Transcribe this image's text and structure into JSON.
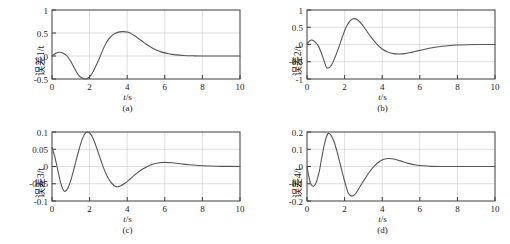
{
  "figure": {
    "panel_count": 4,
    "line_color": "#555555",
    "axis_color": "#3c3c3c",
    "grid_color": "#c8c8c8",
    "background": "#ffffff"
  },
  "panels": [
    {
      "id": "a",
      "caption": "(a)",
      "ylabel": "误差1/t",
      "xlabel_html": "<i>t</i>/s",
      "xticks": [
        "0",
        "2",
        "4",
        "6",
        "8",
        "10"
      ],
      "yticks": [
        "1",
        "0.5",
        "0",
        "-0.5"
      ]
    },
    {
      "id": "b",
      "caption": "(b)",
      "ylabel": "误差2/t",
      "xlabel_html": "<i>t</i>/s",
      "xticks": [
        "0",
        "2",
        "4",
        "6",
        "8",
        "10"
      ],
      "yticks": [
        "1",
        "0.5",
        "0",
        "-0.5",
        "-1"
      ]
    },
    {
      "id": "c",
      "caption": "(c)",
      "ylabel": "误差3/t",
      "xlabel_html": "<i>t</i>/s",
      "xticks": [
        "0",
        "2",
        "4",
        "6",
        "8",
        "10"
      ],
      "yticks": [
        "0.1",
        "0.05",
        "0",
        "-0.05",
        "-0.1"
      ]
    },
    {
      "id": "d",
      "caption": "(d)",
      "ylabel": "误差4/t",
      "xlabel_html": "<i>t</i>/s",
      "xticks": [
        "0",
        "2",
        "4",
        "6",
        "8",
        "10"
      ],
      "yticks": [
        "0.2",
        "0.1",
        "0",
        "-0.1",
        "-0.2"
      ]
    }
  ],
  "chart_data": [
    {
      "type": "line",
      "id": "a",
      "title": "(a)",
      "xlabel": "t/s",
      "ylabel": "误差1/t",
      "xlim": [
        0,
        10
      ],
      "ylim": [
        -0.5,
        1
      ],
      "xticks": [
        0,
        2,
        4,
        6,
        8,
        10
      ],
      "yticks": [
        -0.5,
        0,
        0.5,
        1
      ],
      "grid": true,
      "legend": "none",
      "series": [
        {
          "name": "误差1",
          "x": [
            0,
            0.2,
            0.4,
            0.6,
            0.8,
            1.0,
            1.2,
            1.4,
            1.6,
            1.8,
            2.0,
            2.2,
            2.4,
            2.6,
            2.8,
            3.0,
            3.2,
            3.4,
            3.6,
            3.8,
            4.0,
            4.2,
            4.4,
            4.6,
            4.8,
            5.0,
            5.4,
            5.8,
            6.2,
            6.6,
            7.0,
            7.5,
            8.0,
            9.0,
            10.0
          ],
          "y": [
            0.0,
            0.06,
            0.08,
            0.06,
            0.0,
            -0.12,
            -0.27,
            -0.41,
            -0.48,
            -0.5,
            -0.45,
            -0.33,
            -0.16,
            0.03,
            0.22,
            0.36,
            0.45,
            0.5,
            0.525,
            0.53,
            0.52,
            0.49,
            0.44,
            0.38,
            0.32,
            0.26,
            0.16,
            0.09,
            0.05,
            0.025,
            0.012,
            0.004,
            0.0,
            0.0,
            0.0
          ]
        }
      ]
    },
    {
      "type": "line",
      "id": "b",
      "title": "(b)",
      "xlabel": "t/s",
      "ylabel": "误差2/t",
      "xlim": [
        0,
        10
      ],
      "ylim": [
        -1,
        1
      ],
      "xticks": [
        0,
        2,
        4,
        6,
        8,
        10
      ],
      "yticks": [
        -1,
        -0.5,
        0,
        0.5,
        1
      ],
      "grid": true,
      "legend": "none",
      "series": [
        {
          "name": "误差2",
          "x": [
            0,
            0.15,
            0.25,
            0.4,
            0.6,
            0.8,
            1.0,
            1.1,
            1.3,
            1.5,
            1.7,
            1.9,
            2.1,
            2.3,
            2.5,
            2.7,
            2.9,
            3.1,
            3.4,
            3.7,
            4.0,
            4.3,
            4.6,
            4.9,
            5.2,
            5.6,
            6.0,
            6.5,
            7.0,
            7.5,
            8.0,
            8.5,
            9.0,
            10.0
          ],
          "y": [
            0.0,
            0.11,
            0.13,
            0.09,
            -0.04,
            -0.3,
            -0.62,
            -0.69,
            -0.6,
            -0.36,
            -0.07,
            0.25,
            0.52,
            0.69,
            0.75,
            0.71,
            0.6,
            0.45,
            0.22,
            0.02,
            -0.13,
            -0.22,
            -0.265,
            -0.275,
            -0.265,
            -0.22,
            -0.17,
            -0.11,
            -0.065,
            -0.035,
            -0.015,
            -0.006,
            -0.002,
            0.0
          ]
        }
      ]
    },
    {
      "type": "line",
      "id": "c",
      "title": "(c)",
      "xlabel": "t/s",
      "ylabel": "误差3/t",
      "xlim": [
        0,
        10
      ],
      "ylim": [
        -0.1,
        0.1
      ],
      "xticks": [
        0,
        2,
        4,
        6,
        8,
        10
      ],
      "yticks": [
        -0.1,
        -0.05,
        0,
        0.05,
        0.1
      ],
      "grid": true,
      "legend": "none",
      "series": [
        {
          "name": "误差3",
          "x": [
            0,
            0.15,
            0.3,
            0.45,
            0.6,
            0.7,
            0.85,
            1.0,
            1.2,
            1.4,
            1.6,
            1.8,
            2.0,
            2.2,
            2.4,
            2.6,
            2.8,
            3.0,
            3.2,
            3.4,
            3.6,
            3.9,
            4.2,
            4.5,
            4.8,
            5.1,
            5.4,
            5.7,
            6.0,
            6.4,
            6.8,
            7.3,
            7.8,
            8.4,
            9.0,
            10.0
          ],
          "y": [
            0.055,
            0.028,
            -0.008,
            -0.045,
            -0.068,
            -0.072,
            -0.062,
            -0.04,
            0.0,
            0.042,
            0.078,
            0.098,
            0.097,
            0.08,
            0.05,
            0.018,
            -0.012,
            -0.035,
            -0.05,
            -0.058,
            -0.057,
            -0.048,
            -0.034,
            -0.02,
            -0.008,
            0.001,
            0.007,
            0.011,
            0.012,
            0.011,
            0.008,
            0.005,
            0.003,
            0.0015,
            0.0005,
            0.0
          ]
        }
      ]
    },
    {
      "type": "line",
      "id": "d",
      "title": "(d)",
      "xlabel": "t/s",
      "ylabel": "误差4/t",
      "xlim": [
        -0.2,
        0.2
      ],
      "ylim": [
        -0.2,
        0.2
      ],
      "xticks": [
        0,
        2,
        4,
        6,
        8,
        10
      ],
      "yticks": [
        -0.2,
        -0.1,
        0,
        0.1,
        0.2
      ],
      "grid": true,
      "legend": "none",
      "series": [
        {
          "name": "误差4",
          "x": [
            0,
            0.1,
            0.2,
            0.35,
            0.5,
            0.65,
            0.8,
            0.95,
            1.1,
            1.25,
            1.4,
            1.6,
            1.8,
            2.0,
            2.2,
            2.4,
            2.6,
            2.8,
            3.0,
            3.3,
            3.6,
            3.9,
            4.2,
            4.5,
            4.8,
            5.1,
            5.4,
            5.8,
            6.2,
            6.6,
            7.0,
            7.5,
            8.0,
            9.0,
            10.0
          ],
          "y": [
            0.0,
            -0.06,
            -0.1,
            -0.115,
            -0.09,
            -0.03,
            0.06,
            0.14,
            0.188,
            0.185,
            0.155,
            0.085,
            0.0,
            -0.085,
            -0.155,
            -0.172,
            -0.155,
            -0.12,
            -0.085,
            -0.035,
            0.005,
            0.032,
            0.045,
            0.045,
            0.038,
            0.028,
            0.018,
            0.009,
            0.004,
            0.001,
            0.0,
            0.0,
            0.0,
            0.0,
            0.0
          ]
        }
      ]
    }
  ]
}
